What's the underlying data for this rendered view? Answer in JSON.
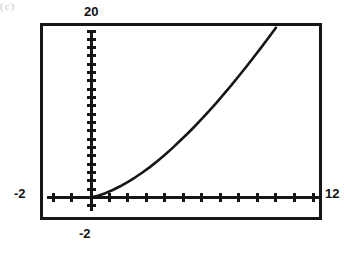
{
  "artifact": {
    "corner_mark": "(c)"
  },
  "graph": {
    "window_labels": {
      "ymax": "20",
      "ymin": "-2",
      "xmin": "-2",
      "xmax": "12"
    }
  },
  "chart_data": {
    "type": "line",
    "title": "",
    "xlabel": "",
    "ylabel": "",
    "xlim": [
      -2,
      12
    ],
    "ylim": [
      -2,
      20
    ],
    "xtick_labels": [
      "-2",
      "12"
    ],
    "ytick_labels": [
      "-2",
      "20"
    ],
    "xscale_step": 1,
    "yscale_step": 1,
    "grid": false,
    "legend": false,
    "axes_style": "calculator-viewport",
    "series": [
      {
        "name": "curve",
        "x": [
          0.0,
          0.4,
          0.8,
          1.2,
          1.6,
          2.0,
          2.4,
          2.8,
          3.2,
          3.6,
          4.0,
          4.4,
          4.8,
          5.2,
          5.6,
          6.0,
          6.4,
          6.8,
          7.2,
          7.6,
          8.0,
          8.4,
          8.8,
          9.2,
          9.6,
          10.0
        ],
        "y": [
          0.0,
          0.22,
          0.52,
          0.9,
          1.35,
          1.85,
          2.4,
          3.0,
          3.65,
          4.35,
          5.1,
          5.9,
          6.75,
          7.6,
          8.5,
          9.45,
          10.4,
          11.4,
          12.45,
          13.5,
          14.6,
          15.7,
          16.85,
          18.0,
          19.2,
          20.4
        ]
      }
    ]
  }
}
